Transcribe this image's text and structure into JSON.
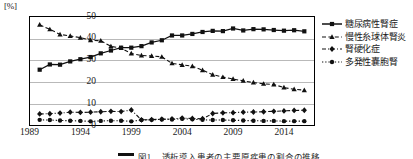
{
  "axis": {
    "unit_label": "[%]",
    "y_ticks": [
      "50",
      "40",
      "30",
      "20",
      "10",
      "0"
    ],
    "x_ticks": [
      "1989",
      "1994",
      "1999",
      "2004",
      "2009",
      "2014"
    ]
  },
  "legend": {
    "items": [
      {
        "label": "糖尿病性腎症",
        "marker": "square-marker",
        "style": "solid"
      },
      {
        "label": "慢性糸球体腎炎",
        "marker": "triangle-marker",
        "style": "dashed"
      },
      {
        "label": "腎硬化症",
        "marker": "diamond-marker",
        "style": "dash-dot"
      },
      {
        "label": "多発性嚢胞腎",
        "marker": "circle-marker",
        "style": "dotted"
      }
    ]
  },
  "caption": {
    "text": "図1 　透析導入患者の主要原疾患の割合の推移"
  },
  "chart_data": {
    "type": "line",
    "title": "",
    "xlabel": "",
    "ylabel": "",
    "unit": "%",
    "xlim": [
      1989,
      2017
    ],
    "ylim": [
      0,
      50
    ],
    "grid": true,
    "legend_position": "right",
    "x": [
      1990,
      1991,
      1992,
      1993,
      1994,
      1995,
      1996,
      1997,
      1998,
      1999,
      2000,
      2001,
      2002,
      2003,
      2004,
      2005,
      2006,
      2007,
      2008,
      2009,
      2010,
      2011,
      2012,
      2013,
      2014,
      2015,
      2016
    ],
    "series": [
      {
        "name": "糖尿病性腎症",
        "marker": "square-marker",
        "style": "solid",
        "values": [
          25.6,
          28.0,
          27.9,
          29.4,
          30.4,
          31.4,
          33.1,
          34.4,
          35.7,
          35.7,
          36.4,
          38.1,
          39.1,
          41.3,
          41.3,
          42.0,
          42.9,
          43.4,
          43.3,
          44.5,
          43.6,
          44.2,
          44.1,
          43.8,
          43.5,
          43.7,
          43.2
        ]
      },
      {
        "name": "慢性糸球体腎炎",
        "marker": "triangle-marker",
        "style": "dashed",
        "values": [
          46.2,
          44.1,
          41.8,
          41.1,
          40.3,
          39.1,
          38.9,
          36.3,
          35.5,
          33.0,
          32.1,
          31.9,
          31.5,
          28.5,
          27.8,
          27.2,
          25.4,
          23.3,
          22.2,
          21.3,
          20.5,
          19.7,
          19.1,
          18.8,
          17.4,
          16.6,
          16.2
        ]
      },
      {
        "name": "腎硬化症",
        "marker": "diamond-marker",
        "style": "dash-dot",
        "values": [
          5.3,
          5.4,
          5.7,
          6.1,
          6.0,
          6.1,
          6.3,
          6.5,
          6.4,
          7.1,
          2.6,
          2.7,
          2.9,
          3.0,
          3.4,
          3.2,
          3.1,
          5.5,
          5.8,
          5.9,
          6.1,
          6.2,
          6.3,
          6.5,
          6.7,
          6.9,
          7.0
        ]
      },
      {
        "name": "多発性嚢胞腎",
        "marker": "circle-marker",
        "style": "dotted",
        "values": [
          2.6,
          2.5,
          2.3,
          2.2,
          2.1,
          1.9,
          2.1,
          2.2,
          2.2,
          1.9,
          2.5,
          2.6,
          2.8,
          2.8,
          3.1,
          2.9,
          2.6,
          2.5,
          2.5,
          2.4,
          2.3,
          2.2,
          2.1,
          2.1,
          2.0,
          2.0,
          2.0
        ]
      }
    ]
  }
}
